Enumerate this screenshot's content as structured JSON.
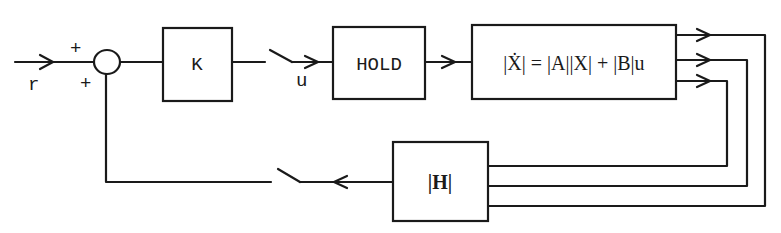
{
  "diagram": {
    "type": "sampled-data state feedback block diagram",
    "input": {
      "label": "r",
      "sign": "+"
    },
    "summing_junction": {
      "input_sign_top": "+",
      "input_sign_bottom": "+"
    },
    "blocks": {
      "gain": {
        "label": "K"
      },
      "hold": {
        "label": "HOLD"
      },
      "plant": {
        "label": "|Ẋ| = |A||X| + |B|u"
      },
      "output_matrix": {
        "label": "|H|"
      }
    },
    "signals": {
      "control": {
        "label": "u"
      }
    },
    "switches": [
      "sampler-forward",
      "sampler-feedback"
    ],
    "state_outputs_count": 3
  }
}
